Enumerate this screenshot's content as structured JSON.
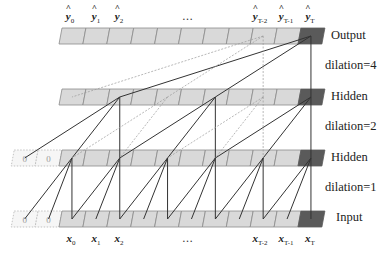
{
  "figure": {
    "type": "dilated-causal-convolution-diagram",
    "layers": [
      {
        "id": "output",
        "label": "Output",
        "padding_cells": 0
      },
      {
        "id": "hidden2",
        "label": "Hidden",
        "padding_cells": 0
      },
      {
        "id": "hidden1",
        "label": "Hidden",
        "padding_cells": 2
      },
      {
        "id": "input",
        "label": "Input",
        "padding_cells": 2
      }
    ],
    "dilations": [
      {
        "label": "dilation=4",
        "between": [
          "hidden2",
          "output"
        ]
      },
      {
        "label": "dilation=2",
        "between": [
          "hidden1",
          "hidden2"
        ]
      },
      {
        "label": "dilation=1",
        "between": [
          "input",
          "hidden1"
        ]
      }
    ],
    "cells_per_layer": 11,
    "padding_value": "0",
    "colors": {
      "cell_fill": "#d9d9d9",
      "cell_border": "#8a8a8a",
      "last_cell_fill": "#5a5a5a",
      "active_line": "#333333",
      "inactive_line": "#9a9a9a"
    }
  },
  "labels": {
    "output": "Output",
    "hidden_top": "Hidden",
    "hidden_bottom": "Hidden",
    "input": "Input",
    "dilation4": "dilation=4",
    "dilation2": "dilation=2",
    "dilation1": "dilation=1",
    "ellipsis": "…",
    "pad0": "0"
  },
  "output_symbols": [
    {
      "base": "y",
      "sub": "0"
    },
    {
      "base": "y",
      "sub": "1"
    },
    {
      "base": "y",
      "sub": "2"
    },
    {
      "base": "y",
      "sub": "T-2"
    },
    {
      "base": "y",
      "sub": "T-1"
    },
    {
      "base": "y",
      "sub": "T"
    }
  ],
  "input_symbols": [
    {
      "base": "x",
      "sub": "0"
    },
    {
      "base": "x",
      "sub": "1"
    },
    {
      "base": "x",
      "sub": "2"
    },
    {
      "base": "x",
      "sub": "T-2"
    },
    {
      "base": "x",
      "sub": "T-1"
    },
    {
      "base": "x",
      "sub": "T"
    }
  ]
}
